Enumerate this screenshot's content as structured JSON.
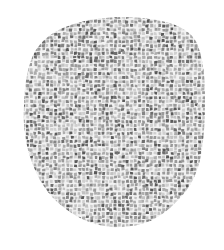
{
  "image": {
    "description": "Rounded blob shape filled with grey mosaic / cracked-tile texture on white background",
    "background_color": "#ffffff",
    "shape": {
      "outline_points": [
        [
          120,
          17
        ],
        [
          150,
          19
        ],
        [
          175,
          25
        ],
        [
          192,
          36
        ],
        [
          200,
          52
        ],
        [
          204,
          75
        ],
        [
          205,
          100
        ],
        [
          204,
          130
        ],
        [
          200,
          160
        ],
        [
          190,
          185
        ],
        [
          172,
          206
        ],
        [
          150,
          221
        ],
        [
          122,
          227
        ],
        [
          95,
          224
        ],
        [
          70,
          212
        ],
        [
          48,
          192
        ],
        [
          33,
          165
        ],
        [
          25,
          135
        ],
        [
          24,
          105
        ],
        [
          27,
          75
        ],
        [
          36,
          50
        ],
        [
          55,
          32
        ],
        [
          85,
          21
        ]
      ]
    },
    "texture": {
      "type": "mosaic",
      "tile_colors": [
        "#5a5a5a",
        "#6e6e6e",
        "#858585",
        "#9a9a9a",
        "#adadad",
        "#c2c2c2",
        "#d0d0d0"
      ],
      "grout_color": "#f2f2f2",
      "tile_size_px": 4
    }
  }
}
